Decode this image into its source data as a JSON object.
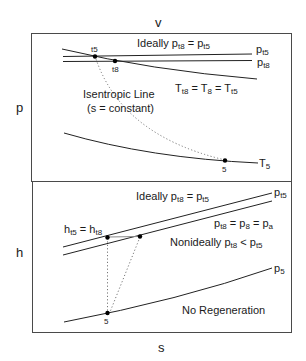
{
  "figure": {
    "type": "thermodynamic state diagrams",
    "panels": [
      {
        "id": "p-v",
        "x_axis_label": "v",
        "y_axis_label": "p",
        "annotations": {
          "ideal": "Ideally p",
          "ideal_sub1": "t8",
          "ideal_eq": " = p",
          "ideal_sub2": "t5",
          "isentropic_line_1": "Isentropic Line",
          "isentropic_line_2": "(s = constant)",
          "temp_eq_T": "T",
          "temp_eq_sub1": "t8",
          "temp_eq_mid": " = T",
          "temp_eq_sub2": "8",
          "temp_eq_mid2": " = T",
          "temp_eq_sub3": "t5"
        },
        "curve_labels": {
          "pt5_p": "p",
          "pt5_sub": "t5",
          "pt8_p": "p",
          "pt8_sub": "t8",
          "T5_T": "T",
          "T5_sub": "5"
        },
        "points": [
          {
            "label": "t5"
          },
          {
            "label": "t8"
          },
          {
            "label": "5"
          }
        ]
      },
      {
        "id": "h-s",
        "x_axis_label": "s",
        "y_axis_label": "h",
        "annotations": {
          "ideal": "Ideally p",
          "ideal_sub1": "t8",
          "ideal_eq": " = p",
          "ideal_sub2": "t5",
          "h_eq_h": "h",
          "h_eq_sub1": "t5",
          "h_eq_mid": " = h",
          "h_eq_sub2": "t8",
          "p_eq_p": "p",
          "p_eq_sub1": "t8",
          "p_eq_mid": " = p",
          "p_eq_sub2": "8",
          "p_eq_mid2": " = p",
          "p_eq_sub3": "a",
          "nonideal": "Nonideally p",
          "nonideal_sub1": "t8",
          "nonideal_lt": " < p",
          "nonideal_sub2": "t5",
          "no_regen": "No Regeneration"
        },
        "curve_labels": {
          "pt5_p": "p",
          "pt5_sub": "t5",
          "p5_p": "p",
          "p5_sub": "5"
        },
        "points": [
          {
            "label": "5"
          }
        ]
      }
    ]
  }
}
